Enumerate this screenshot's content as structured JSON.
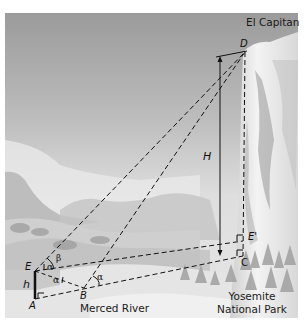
{
  "figure": {
    "place_labels": {
      "el_capitan": "El Capitan",
      "merced_river": "Merced River",
      "yosemite_line1": "Yosemite",
      "yosemite_line2": "National Park"
    },
    "point_labels": {
      "D": "D",
      "E": "E",
      "A": "A",
      "B": "B",
      "C": "C",
      "E_prime": "E'",
      "H": "H",
      "h": "h"
    },
    "angle_labels": {
      "beta": "β",
      "alpha_at_E_upper": "α",
      "alpha_at_E_lower": "α",
      "alpha_at_B": "α"
    },
    "colors": {
      "sky_top": "#9a9a9a",
      "sky_bottom": "#d9d9d9",
      "cliff": "#eeeeee",
      "line": "#111111"
    }
  }
}
